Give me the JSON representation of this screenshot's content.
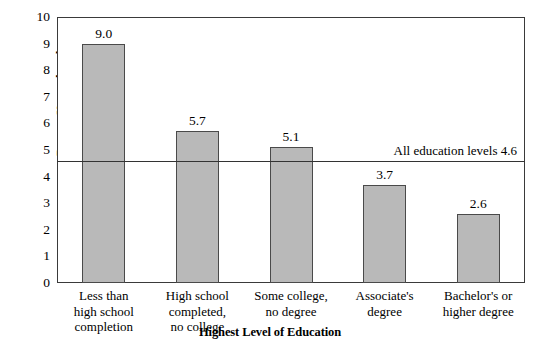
{
  "chart_data": {
    "type": "bar",
    "title": "",
    "xlabel": "Highest Level of Education",
    "ylabel": "Percent Unemployed",
    "categories": [
      "Less than\nhigh school\ncompletion",
      "High school\ncompleted,\nno college",
      "Some college,\nno degree",
      "Associate's\ndegree",
      "Bachelor's or\nhigher degree"
    ],
    "values": [
      9.0,
      5.7,
      5.1,
      3.7,
      2.6
    ],
    "value_labels": [
      "9.0",
      "5.7",
      "5.1",
      "3.7",
      "2.6"
    ],
    "ylim": [
      0,
      10
    ],
    "yticks": [
      0,
      1,
      2,
      3,
      4,
      5,
      6,
      7,
      8,
      9,
      10
    ],
    "ytick_labels": [
      "0",
      "1",
      "2",
      "3",
      "4",
      "5",
      "6",
      "7",
      "8",
      "9",
      "10"
    ],
    "grid": false,
    "legend": "none",
    "bar_color": "#b9b9b9",
    "bar_edge_color": "#4a4a4a",
    "axis_color": "#3a3a3a",
    "reference_line": {
      "value": 4.6,
      "label": "All education levels 4.6",
      "color": "#333333"
    }
  },
  "axes": {
    "y_title": "Percent Unemployed",
    "x_title": "Highest Level of Education"
  }
}
